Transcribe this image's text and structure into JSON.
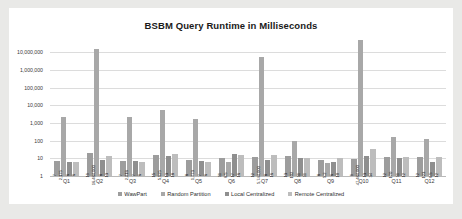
{
  "chart_data": {
    "type": "bar",
    "title": "BSBM Query Runtime in Milliseconds",
    "xlabel": "",
    "ylabel": "",
    "yscale": "log",
    "ylim": [
      1,
      30000000
    ],
    "grid": true,
    "legend_position": "bottom",
    "ytick_labels": [
      "10,000,000",
      "1,000,000",
      "100,000",
      "10,000",
      "1,000",
      "100",
      "10",
      "1"
    ],
    "ytick_values": [
      10000000,
      1000000,
      100000,
      10000,
      1000,
      100,
      10,
      1
    ],
    "categories": [
      "Q1",
      "Q2",
      "Q3",
      "Q4",
      "Q5",
      "Q6",
      "Q7",
      "Q8",
      "Q9",
      "Q10",
      "Q11",
      "Q12"
    ],
    "series": [
      {
        "name": "WawPart",
        "color": "#9d9d9d",
        "values": [
          7,
          19,
          7,
          15,
          8,
          11,
          12,
          13,
          8,
          9,
          12,
          12
        ],
        "labels": [
          "7",
          "19",
          "7",
          "15",
          "8",
          "11",
          "12",
          "13",
          "8",
          "9",
          "12",
          "12"
        ]
      },
      {
        "name": "Random Partition",
        "color": "#a8a8a8",
        "values": [
          2175,
          16484000,
          2218,
          5525,
          1773,
          6.5,
          5744000,
          102,
          5.2,
          47484000,
          170,
          123
        ],
        "labels": [
          "2,175",
          "16,484,000",
          "2,218",
          "5,525",
          "1,773",
          "6.5",
          "5,744,000",
          "102",
          "5.2",
          "47,484,000",
          "170",
          "123"
        ]
      },
      {
        "name": "Local Centralized",
        "color": "#8f8f8f",
        "values": [
          6,
          8,
          7,
          13,
          7,
          17,
          8,
          11,
          6,
          13,
          11,
          6.5
        ],
        "labels": [
          "6",
          "8",
          "7",
          "13",
          "7",
          "17",
          "8",
          "11",
          "6",
          "13",
          "11",
          "6.5"
        ]
      },
      {
        "name": "Remote Centralized",
        "color": "#bdbdbd",
        "values": [
          6,
          13,
          6,
          18,
          6,
          16,
          16,
          11,
          10,
          34,
          12,
          12
        ],
        "labels": [
          "6",
          "13",
          "6",
          "18",
          "6",
          "16",
          "16",
          "11",
          "10",
          "34",
          "12",
          "12"
        ]
      }
    ]
  }
}
